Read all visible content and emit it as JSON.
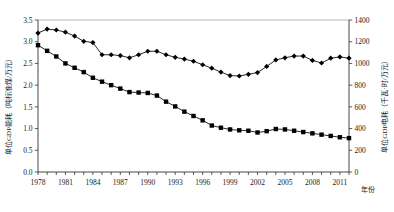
{
  "chart_data": {
    "type": "line",
    "title": "",
    "xlabel": "年份",
    "ylabel": "单位GDP能耗（吨标准煤/万元）",
    "y2label": "单位GDP电耗（千瓦·时/万元）",
    "grid": false,
    "legend": "none",
    "xlim": [
      1978,
      2012
    ],
    "ylim": [
      0.0,
      3.5
    ],
    "y2lim": [
      0,
      1400
    ],
    "xticks": [
      1978,
      1981,
      1984,
      1987,
      1990,
      1993,
      1996,
      1999,
      2002,
      2005,
      2008,
      2011
    ],
    "yticks": [
      "0.0",
      "0.5",
      "1.0",
      "1.5",
      "2.0",
      "2.5",
      "3.0",
      "3.5"
    ],
    "y2ticks": [
      "0",
      "200",
      "400",
      "600",
      "800",
      "1000",
      "1200",
      "1400"
    ],
    "x": [
      1978,
      1979,
      1980,
      1981,
      1982,
      1983,
      1984,
      1985,
      1986,
      1987,
      1988,
      1989,
      1990,
      1991,
      1992,
      1993,
      1994,
      1995,
      1996,
      1997,
      1998,
      1999,
      2000,
      2001,
      2002,
      2003,
      2004,
      2005,
      2006,
      2007,
      2008,
      2009,
      2010,
      2011,
      2012
    ],
    "series": [
      {
        "name": "单位GDP电耗（千瓦·时/万元）",
        "marker": "diamond",
        "axis": "right",
        "values": [
          3.2,
          3.29,
          3.27,
          3.22,
          3.13,
          3.01,
          2.98,
          2.7,
          2.7,
          2.68,
          2.63,
          2.7,
          2.78,
          2.78,
          2.7,
          2.64,
          2.6,
          2.55,
          2.47,
          2.39,
          2.3,
          2.22,
          2.21,
          2.25,
          2.29,
          2.43,
          2.58,
          2.63,
          2.67,
          2.67,
          2.57,
          2.51,
          2.62,
          2.65,
          2.62
        ]
      },
      {
        "name": "单位GDP能耗（吨标准煤/万元）",
        "marker": "square",
        "axis": "left",
        "values": [
          2.92,
          2.79,
          2.66,
          2.5,
          2.4,
          2.3,
          2.17,
          2.08,
          2.0,
          1.92,
          1.84,
          1.83,
          1.82,
          1.76,
          1.62,
          1.51,
          1.39,
          1.29,
          1.19,
          1.07,
          1.02,
          0.98,
          0.96,
          0.95,
          0.91,
          0.94,
          0.99,
          0.98,
          0.95,
          0.92,
          0.89,
          0.86,
          0.83,
          0.8,
          0.78
        ]
      }
    ]
  },
  "axes": {
    "x_axis_title": "年份",
    "y_left_title": "单位GDP能耗（吨标准煤/万元）",
    "y_right_title": "单位GDP电耗（千瓦·时/万元）"
  }
}
